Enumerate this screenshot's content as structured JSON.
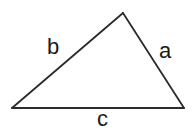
{
  "diagram": {
    "type": "triangle-diagram",
    "background_color": "#ffffff",
    "stroke_color": "#2b2b2b",
    "stroke_width": 1.8,
    "text_color": "#1a1a1a",
    "vertices": {
      "apex": {
        "x": 123,
        "y": 13
      },
      "bottom_left": {
        "x": 12,
        "y": 108
      },
      "bottom_right": {
        "x": 184,
        "y": 108
      }
    },
    "sides": [
      {
        "id": "side-a",
        "label": "a",
        "from": "apex",
        "to": "bottom_right",
        "label_position": {
          "x": 159,
          "y": 40
        }
      },
      {
        "id": "side-b",
        "label": "b",
        "from": "bottom_left",
        "to": "apex",
        "label_position": {
          "x": 47,
          "y": 36
        }
      },
      {
        "id": "side-c",
        "label": "c",
        "from": "bottom_left",
        "to": "bottom_right",
        "label_position": {
          "x": 97,
          "y": 108
        }
      }
    ]
  }
}
